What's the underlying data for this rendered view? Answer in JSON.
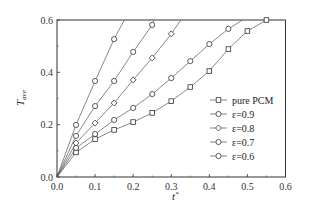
{
  "chart_data": {
    "type": "line",
    "title": "",
    "xlabel": "t*",
    "ylabel": "T_ave",
    "xlim": [
      0.0,
      0.6
    ],
    "ylim": [
      0.0,
      0.6
    ],
    "xticks": [
      "0.0",
      "0.1",
      "0.2",
      "0.3",
      "0.4",
      "0.5",
      "0.6"
    ],
    "yticks": [
      "0.0",
      "0.2",
      "0.4",
      "0.6"
    ],
    "grid": false,
    "legend_position": "lower right",
    "series": [
      {
        "name": "pure PCM",
        "marker": "square",
        "x": [
          0.0,
          0.05,
          0.1,
          0.15,
          0.2,
          0.25,
          0.3,
          0.35,
          0.4,
          0.45,
          0.5,
          0.55
        ],
        "y": [
          0.0,
          0.094,
          0.145,
          0.18,
          0.21,
          0.245,
          0.29,
          0.344,
          0.405,
          0.489,
          0.558,
          0.6
        ]
      },
      {
        "name": "ε=0.9",
        "marker": "circle",
        "x": [
          0.0,
          0.05,
          0.1,
          0.15,
          0.2,
          0.25,
          0.3,
          0.35,
          0.4,
          0.45,
          0.487
        ],
        "y": [
          0.0,
          0.111,
          0.164,
          0.218,
          0.264,
          0.317,
          0.378,
          0.443,
          0.508,
          0.566,
          0.6
        ]
      },
      {
        "name": "ε=0.8",
        "marker": "diamond",
        "x": [
          0.0,
          0.05,
          0.1,
          0.15,
          0.2,
          0.25,
          0.3,
          0.325
        ],
        "y": [
          0.0,
          0.13,
          0.206,
          0.283,
          0.371,
          0.455,
          0.547,
          0.6
        ]
      },
      {
        "name": "ε=0.7",
        "marker": "circle",
        "x": [
          0.0,
          0.05,
          0.1,
          0.15,
          0.2,
          0.25,
          0.255
        ],
        "y": [
          0.0,
          0.157,
          0.271,
          0.367,
          0.478,
          0.581,
          0.6
        ]
      },
      {
        "name": "ε=0.6",
        "marker": "circle",
        "x": [
          0.0,
          0.05,
          0.1,
          0.15,
          0.177
        ],
        "y": [
          0.0,
          0.199,
          0.367,
          0.527,
          0.6
        ]
      }
    ],
    "marker_points": {
      "pure PCM": [
        [
          0.05,
          0.094
        ],
        [
          0.1,
          0.145
        ],
        [
          0.15,
          0.18
        ],
        [
          0.2,
          0.21
        ],
        [
          0.25,
          0.245
        ],
        [
          0.3,
          0.29
        ],
        [
          0.35,
          0.344
        ],
        [
          0.4,
          0.405
        ],
        [
          0.45,
          0.489
        ],
        [
          0.5,
          0.558
        ],
        [
          0.55,
          0.6
        ]
      ],
      "ε=0.9": [
        [
          0.05,
          0.111
        ],
        [
          0.1,
          0.164
        ],
        [
          0.15,
          0.218
        ],
        [
          0.2,
          0.264
        ],
        [
          0.25,
          0.317
        ],
        [
          0.3,
          0.378
        ],
        [
          0.35,
          0.443
        ],
        [
          0.4,
          0.508
        ],
        [
          0.45,
          0.566
        ]
      ],
      "ε=0.8": [
        [
          0.05,
          0.13
        ],
        [
          0.1,
          0.206
        ],
        [
          0.15,
          0.283
        ],
        [
          0.2,
          0.371
        ],
        [
          0.25,
          0.455
        ],
        [
          0.3,
          0.547
        ]
      ],
      "ε=0.7": [
        [
          0.05,
          0.157
        ],
        [
          0.1,
          0.271
        ],
        [
          0.15,
          0.367
        ],
        [
          0.2,
          0.478
        ],
        [
          0.25,
          0.581
        ]
      ],
      "ε=0.6": [
        [
          0.05,
          0.199
        ],
        [
          0.1,
          0.367
        ],
        [
          0.15,
          0.527
        ]
      ]
    }
  },
  "axes": {
    "xlabel_main": "t",
    "xlabel_sup": "*",
    "ylabel_main": "T",
    "ylabel_sub": "ave"
  },
  "legend": {
    "items": [
      {
        "label": "pure PCM",
        "marker": "square"
      },
      {
        "label": "ε=0.9",
        "marker": "circle"
      },
      {
        "label": "ε=0.8",
        "marker": "diamond"
      },
      {
        "label": "ε=0.7",
        "marker": "circle"
      },
      {
        "label": "ε=0.6",
        "marker": "circle"
      }
    ]
  }
}
